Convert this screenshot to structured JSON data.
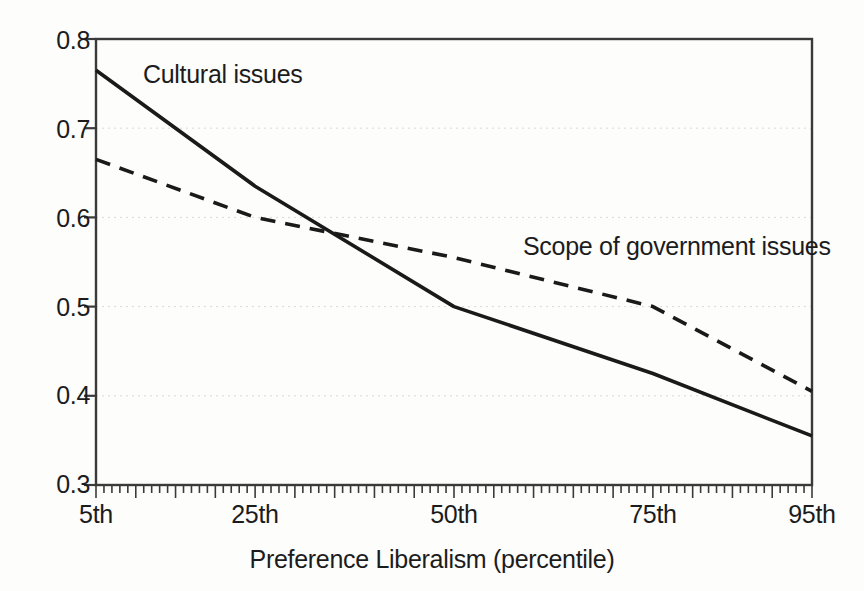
{
  "chart_data": {
    "type": "line",
    "title": "",
    "subtitle": "",
    "xlabel": "Preference Liberalism (percentile)",
    "ylabel": "",
    "x": [
      5,
      25,
      50,
      75,
      95
    ],
    "xtick_labels": [
      "5th",
      "25th",
      "50th",
      "75th",
      "95th"
    ],
    "ytick_labels": [
      "0.3",
      "0.4",
      "0.5",
      "0.6",
      "0.7",
      "0.8"
    ],
    "yticks": [
      0.3,
      0.4,
      0.5,
      0.6,
      0.7,
      0.8
    ],
    "xlim": [
      5,
      95
    ],
    "ylim": [
      0.3,
      0.8
    ],
    "grid": "horizontal-dotted",
    "legend_position": "inline-annotations",
    "series": [
      {
        "name": "Cultural issues",
        "style": "solid",
        "color": "#1a1a1a",
        "x": [
          5,
          25,
          50,
          75,
          95
        ],
        "values": [
          0.765,
          0.635,
          0.5,
          0.425,
          0.355
        ],
        "label_x": 25,
        "label_y": 0.755
      },
      {
        "name": "Scope of government issues",
        "style": "dashed",
        "color": "#1a1a1a",
        "x": [
          5,
          25,
          50,
          75,
          95
        ],
        "values": [
          0.665,
          0.6,
          0.555,
          0.5,
          0.405
        ],
        "label_x": 68,
        "label_y": 0.565
      }
    ],
    "annotations": [
      {
        "text": "Cultural issues"
      },
      {
        "text": "Scope of government issues"
      }
    ]
  },
  "axis": {
    "y_labels": [
      "0.8",
      "0.7",
      "0.6",
      "0.5",
      "0.4",
      "0.3"
    ],
    "x_labels": [
      "5th",
      "25th",
      "50th",
      "75th",
      "95th"
    ],
    "x_title": "Preference Liberalism (percentile)"
  },
  "labels": {
    "cultural": "Cultural issues",
    "scope": "Scope of government issues"
  },
  "colors": {
    "line": "#1a1a1a",
    "axis": "#3a3a3a",
    "grid": "#d9d9d9",
    "background": "#fdfdfc",
    "text": "#1c1c1c"
  }
}
